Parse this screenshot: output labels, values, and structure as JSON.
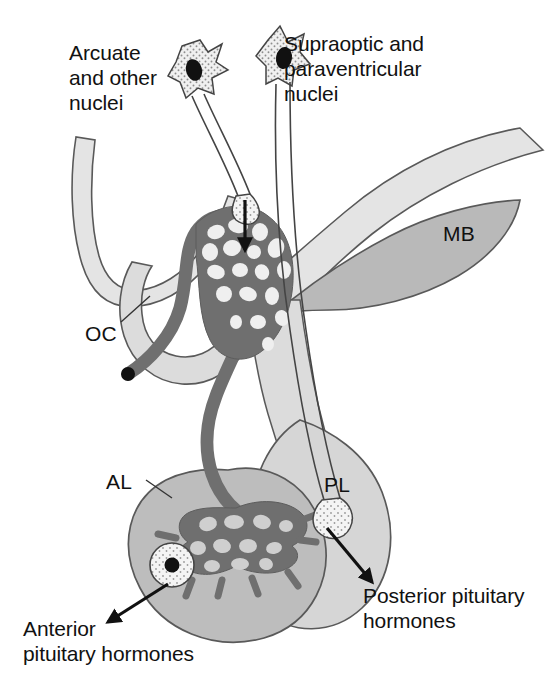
{
  "figure": {
    "background_color": "#ffffff",
    "width": 558,
    "height": 687
  },
  "palette": {
    "outline": "#4d4d4d",
    "text": "#111111",
    "brain_light": "#e2e2e2",
    "brain_mid": "#d2d2d2",
    "mb_fill": "#b9b9b9",
    "pituitary_anterior": "#bdbdbd",
    "pituitary_posterior": "#d6d6d6",
    "vessel_dark": "#6f6f6f",
    "neuron_fill": "#f2f2f2",
    "nucleus_black": "#111111",
    "stipple": "#8a8a8a"
  },
  "labels": {
    "arcuate": "Arcuate\nand other\nnuclei",
    "supraoptic": "Supraoptic and\nparaventricular\nnuclei",
    "mb": "MB",
    "oc": "OC",
    "al": "AL",
    "pl": "PL",
    "posterior_hormones": "Posterior pituitary\nhormones",
    "anterior_hormones": "Anterior\npituitary hormones"
  },
  "structures": [
    {
      "name": "hypothalamus",
      "label_key": "",
      "fill": "#e2e2e2"
    },
    {
      "name": "mammillary-body",
      "label_key": "mb",
      "fill": "#b9b9b9"
    },
    {
      "name": "optic-chiasm",
      "label_key": "oc",
      "fill": "#dcdcdc"
    },
    {
      "name": "anterior-lobe",
      "label_key": "al",
      "fill": "#bdbdbd"
    },
    {
      "name": "posterior-lobe",
      "label_key": "pl",
      "fill": "#d6d6d6"
    },
    {
      "name": "portal-capillary-plexus",
      "label_key": "",
      "fill": "#6f6f6f"
    },
    {
      "name": "median-eminence-capillaries",
      "label_key": "",
      "fill": "#6f6f6f"
    }
  ],
  "neurons": [
    {
      "name": "arcuate-neuron",
      "terminal": "median-eminence"
    },
    {
      "name": "supraoptic-paraventricular-neuron",
      "terminal": "posterior-lobe"
    }
  ],
  "arrows": [
    {
      "name": "median-eminence-release-arrow",
      "direction": "down"
    },
    {
      "name": "posterior-hormone-arrow",
      "direction": "down-right"
    },
    {
      "name": "anterior-hormone-arrow",
      "direction": "down-left"
    }
  ]
}
